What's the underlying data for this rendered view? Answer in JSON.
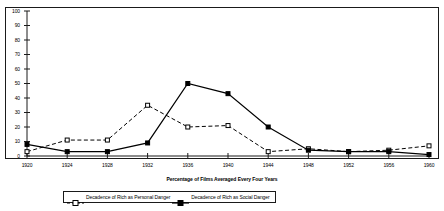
{
  "chart_data": {
    "type": "line",
    "title": "",
    "xlabel": "Percentage of Films Averaged Every Four Years",
    "ylabel": "",
    "x": [
      1920,
      1924,
      1928,
      1932,
      1936,
      1940,
      1944,
      1948,
      1952,
      1956,
      1960
    ],
    "xtick_labels": [
      "1920",
      "1924",
      "1928",
      "1932",
      "1936",
      "1940",
      "1944",
      "1948",
      "1952",
      "1956",
      "1960"
    ],
    "ytick_labels": [
      "0",
      "10",
      "20",
      "30",
      "40",
      "50",
      "60",
      "70",
      "80",
      "90",
      "100"
    ],
    "yticks": [
      0,
      10,
      20,
      30,
      40,
      50,
      60,
      70,
      80,
      90,
      100
    ],
    "xlim": [
      1920,
      1960
    ],
    "ylim": [
      0,
      100
    ],
    "grid": false,
    "legend_position": "bottom",
    "series": [
      {
        "name": "Decadence of Rich as Personal Danger",
        "marker": "open-square",
        "linestyle": "dashed",
        "color": "#000000",
        "values": [
          3,
          11,
          11,
          35,
          20,
          21,
          3,
          5,
          3,
          4,
          7
        ]
      },
      {
        "name": "Decadence of Rich as Social Danger",
        "marker": "filled-square",
        "linestyle": "solid",
        "color": "#000000",
        "values": [
          8,
          3,
          3,
          9,
          50,
          43,
          20,
          4,
          3,
          3,
          1
        ]
      }
    ]
  },
  "axis": {
    "x_title": "Percentage of Films Averaged Every Four Years"
  },
  "legend": {
    "entries": [
      {
        "label": "Decadence of Rich as Personal Danger"
      },
      {
        "label": "Decadence of Rich as Social Danger"
      }
    ]
  }
}
